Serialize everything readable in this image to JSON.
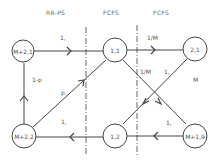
{
  "diagram": {
    "headers": [
      {
        "label": "RR-PS"
      },
      {
        "label": "FCFS"
      },
      {
        "label": "FCFS"
      }
    ],
    "nodes": [
      {
        "id": "n_m21",
        "label": "M+2,1"
      },
      {
        "id": "n_11",
        "label": "1,1"
      },
      {
        "id": "n_21",
        "label": "2,1"
      },
      {
        "id": "n_m22",
        "label": "M+2,2"
      },
      {
        "id": "n_12",
        "label": "1,2"
      },
      {
        "id": "n_m19",
        "label": "M+1,9"
      }
    ],
    "edges": [
      {
        "from": "M+2,1",
        "to": "1,1",
        "label": "1"
      },
      {
        "from": "1,1",
        "to": "2,1",
        "label": "1/M"
      },
      {
        "from": "1,1",
        "to": "M+1,9",
        "label": "1/M"
      },
      {
        "from": "M+1,9",
        "to": "1,2",
        "label": "1"
      },
      {
        "from": "2,1",
        "to": "1,2",
        "label": "M"
      },
      {
        "from": "1,2",
        "to": "M+2,2",
        "label": "1"
      },
      {
        "from": "M+2,2",
        "to": "M+2,1",
        "label": "1-p"
      },
      {
        "from": "M+2,2",
        "to": "1,1",
        "label": "p"
      }
    ],
    "edge_labels": {
      "top_left": "1,",
      "top_right": "1/M",
      "cross_left": "1/M",
      "cross_right": "1,",
      "right_m": "M",
      "left_vertical": "1-p",
      "diagonal_p": "p",
      "bottom_left": "1,",
      "bottom_right": "1,"
    }
  }
}
